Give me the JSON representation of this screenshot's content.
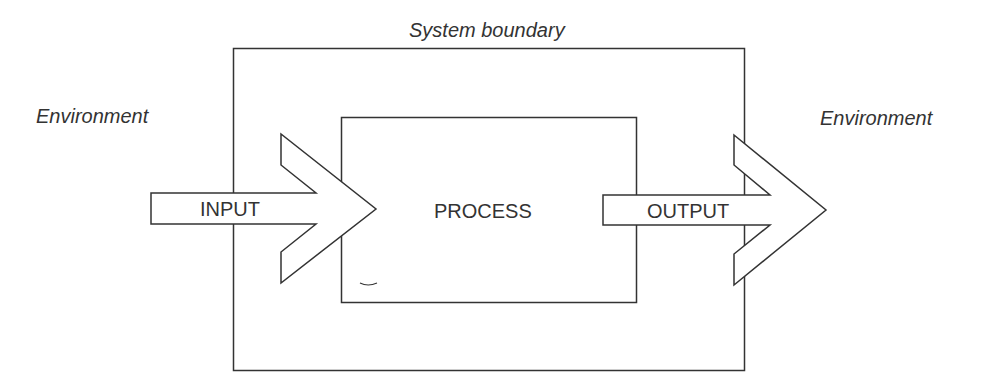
{
  "title": "System boundary",
  "environment_left": "Environment",
  "environment_right": "Environment",
  "input_label": "INPUT",
  "process_label": "PROCESS",
  "output_label": "OUTPUT",
  "colors": {
    "stroke": "#333333",
    "fill": "#ffffff"
  }
}
